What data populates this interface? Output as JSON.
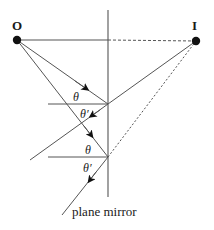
{
  "diagram": {
    "labels": {
      "object": "O",
      "image": "I",
      "theta1": "θ",
      "theta1_prime": "θ′",
      "theta2": "θ",
      "theta2_prime": "θ′",
      "mirror": "plane mirror"
    },
    "points": {
      "O": [
        17,
        40
      ],
      "I": [
        196,
        41
      ],
      "P1": [
        108,
        104
      ],
      "P2": [
        108,
        157
      ]
    },
    "colors": {
      "line": "#555555",
      "dot": "#111111",
      "text": "#1a1a1a"
    }
  }
}
